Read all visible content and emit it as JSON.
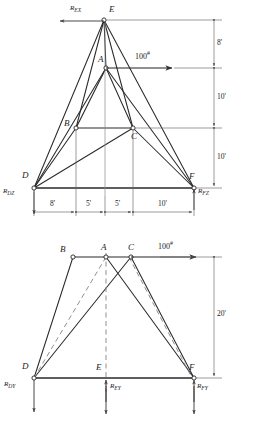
{
  "figure": {
    "views": [
      {
        "name": "elevation-view",
        "nodes": [
          {
            "id": "E",
            "label": "E",
            "x": 104,
            "y": 20
          },
          {
            "id": "A",
            "label": "A",
            "x": 106,
            "y": 68
          },
          {
            "id": "B",
            "label": "B",
            "x": 76,
            "y": 128
          },
          {
            "id": "C",
            "label": "C",
            "x": 133,
            "y": 128
          },
          {
            "id": "D",
            "label": "D",
            "x": 34,
            "y": 188
          },
          {
            "id": "F",
            "label": "F",
            "x": 194,
            "y": 188
          }
        ],
        "members": [
          [
            "E",
            "D"
          ],
          [
            "E",
            "B"
          ],
          [
            "E",
            "A"
          ],
          [
            "E",
            "C"
          ],
          [
            "E",
            "F"
          ],
          [
            "A",
            "B"
          ],
          [
            "A",
            "C"
          ],
          [
            "A",
            "D"
          ],
          [
            "A",
            "F"
          ],
          [
            "B",
            "C"
          ],
          [
            "B",
            "D"
          ],
          [
            "C",
            "D"
          ],
          [
            "C",
            "F"
          ],
          [
            "D",
            "F"
          ]
        ],
        "load": {
          "label": "100",
          "unit": "#",
          "value": 100,
          "direction": "right",
          "at": "A"
        },
        "reactions": [
          {
            "label": "R",
            "sub": "EX",
            "at": "E",
            "direction": "left"
          },
          {
            "label": "R",
            "sub": "DZ",
            "at": "D",
            "direction": "down"
          },
          {
            "label": "R",
            "sub": "FZ",
            "at": "F",
            "direction": "down"
          }
        ],
        "vertical_dimensions": [
          {
            "label": "8'",
            "value": 8,
            "unit": "ft",
            "from": "E",
            "to": "A"
          },
          {
            "label": "10'",
            "value": 10,
            "unit": "ft",
            "from": "A",
            "to": "BC"
          },
          {
            "label": "10'",
            "value": 10,
            "unit": "ft",
            "from": "BC",
            "to": "DF"
          }
        ],
        "horizontal_dimensions": [
          {
            "label": "8'",
            "value": 8,
            "unit": "ft"
          },
          {
            "label": "5'",
            "value": 5,
            "unit": "ft"
          },
          {
            "label": "5'",
            "value": 5,
            "unit": "ft"
          },
          {
            "label": "10'",
            "value": 10,
            "unit": "ft"
          }
        ]
      },
      {
        "name": "plan-view",
        "nodes": [
          {
            "id": "B",
            "label": "B",
            "x": 73,
            "y": 257
          },
          {
            "id": "A",
            "label": "A",
            "x": 106,
            "y": 257
          },
          {
            "id": "C",
            "label": "C",
            "x": 131,
            "y": 257
          },
          {
            "id": "D",
            "label": "D",
            "x": 34,
            "y": 378
          },
          {
            "id": "E",
            "label": "E",
            "x": 106,
            "y": 378
          },
          {
            "id": "F",
            "label": "F",
            "x": 194,
            "y": 378
          }
        ],
        "members_solid": [
          [
            "B",
            "A"
          ],
          [
            "A",
            "C"
          ],
          [
            "B",
            "D"
          ],
          [
            "C",
            "F"
          ],
          [
            "D",
            "C"
          ],
          [
            "A",
            "F"
          ],
          [
            "D",
            "F"
          ]
        ],
        "members_dashed": [
          [
            "A",
            "D"
          ],
          [
            "C",
            "F"
          ],
          [
            "A",
            "E"
          ]
        ],
        "load": {
          "label": "100",
          "unit": "#",
          "value": 100,
          "direction": "right",
          "at": "C"
        },
        "reactions": [
          {
            "label": "R",
            "sub": "DY",
            "at": "D",
            "direction": "down"
          },
          {
            "label": "R",
            "sub": "EY",
            "at": "E",
            "direction": "down"
          },
          {
            "label": "R",
            "sub": "FY",
            "at": "F",
            "direction": "down"
          }
        ],
        "vertical_dimensions": [
          {
            "label": "20'",
            "value": 20,
            "unit": "ft",
            "from": "top",
            "to": "bottom"
          }
        ]
      }
    ],
    "colors": {
      "line": "#2a2a2a",
      "dim": "#555555",
      "dashed": "#777777",
      "background": "#ffffff"
    }
  }
}
